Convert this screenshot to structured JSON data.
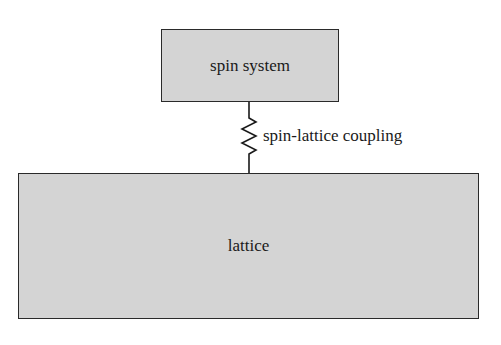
{
  "diagram": {
    "top_box": {
      "label": "spin system",
      "fill": "#d4d4d4"
    },
    "bottom_box": {
      "label": "lattice",
      "fill": "#d4d4d4"
    },
    "connector": {
      "label": "spin-lattice coupling",
      "style": "spring-zigzag"
    }
  }
}
